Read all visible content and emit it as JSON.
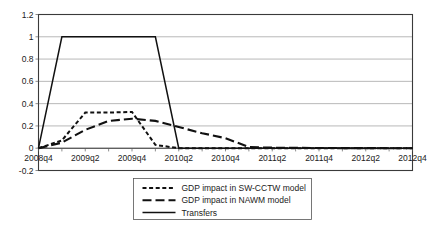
{
  "chart_data": {
    "type": "line",
    "title": "",
    "subtitle": "",
    "xlabel": "",
    "ylabel": "",
    "ylim": [
      -0.2,
      1.2
    ],
    "yticks": [
      -0.2,
      0,
      0.2,
      0.4,
      0.6,
      0.8,
      1,
      1.2
    ],
    "ytick_labels": [
      "-0.2",
      "0",
      "0.2",
      "0.4",
      "0.6",
      "0.8",
      "1",
      "1.2"
    ],
    "grid": true,
    "grid_axis": "y",
    "legend_position": "bottom",
    "x": [
      "2008q4",
      "2009q1",
      "2009q2",
      "2009q3",
      "2009q4",
      "2010q1",
      "2010q2",
      "2010q3",
      "2010q4",
      "2011q1",
      "2011q2",
      "2011q3",
      "2011q4",
      "2012q1",
      "2012q2",
      "2012q3",
      "2012q4"
    ],
    "xtick_labels": [
      "2008q4",
      "2009q2",
      "2009q4",
      "2010q2",
      "2010q4",
      "2011q2",
      "2011q4",
      "2012q2",
      "2012q4"
    ],
    "xtick_indices": [
      0,
      2,
      4,
      6,
      8,
      10,
      12,
      14,
      16
    ],
    "series": [
      {
        "name": "GDP impact in SW-CCTW model",
        "style": "dotted",
        "color": "#111111",
        "values": [
          0,
          0.07,
          0.32,
          0.32,
          0.325,
          0.03,
          0,
          0,
          0,
          0,
          0,
          0,
          0,
          0,
          0,
          0,
          0
        ]
      },
      {
        "name": "GDP impact in NAWM model",
        "style": "dashed",
        "color": "#111111",
        "values": [
          0,
          0.05,
          0.165,
          0.245,
          0.265,
          0.245,
          0.19,
          0.135,
          0.09,
          0.01,
          0.005,
          0.003,
          0.002,
          0.001,
          0.001,
          0.0,
          0.0
        ]
      },
      {
        "name": "Transfers",
        "style": "solid",
        "color": "#111111",
        "values": [
          0,
          1,
          1,
          1,
          1,
          1,
          0,
          0,
          0,
          0,
          0,
          0,
          0,
          0,
          0,
          0,
          0
        ]
      }
    ],
    "legend_entries": [
      {
        "label": "GDP impact in SW-CCTW model",
        "style": "dotted"
      },
      {
        "label": "GDP impact in NAWM model",
        "style": "dashed"
      },
      {
        "label": "Transfers",
        "style": "solid"
      }
    ]
  },
  "colors": {
    "background": "#ffffff",
    "grid": "#9a9a9a",
    "axis": "#3a3a3a",
    "series": "#111111",
    "text": "#1b1b1b"
  }
}
